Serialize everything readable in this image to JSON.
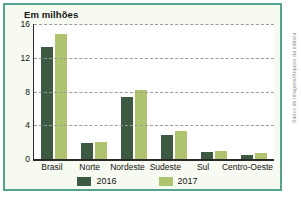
{
  "chart_data": {
    "type": "bar",
    "title": "Em milhões",
    "categories": [
      "Brasil",
      "Norte",
      "Nordeste",
      "Sudeste",
      "Sul",
      "Centro-Oeste"
    ],
    "series": [
      {
        "name": "2016",
        "color": "#3c5a41",
        "values": [
          13.3,
          1.9,
          7.4,
          2.9,
          0.8,
          0.5
        ]
      },
      {
        "name": "2017",
        "color": "#aec46f",
        "values": [
          14.8,
          2.0,
          8.2,
          3.3,
          1.0,
          0.7
        ]
      }
    ],
    "ylabel": "Em milhões",
    "xlabel": "",
    "ylim": [
      0,
      16
    ],
    "yticks": [
      0,
      4,
      8,
      12,
      16
    ],
    "grid": "horizontal-dashed",
    "legend_position": "bottom"
  },
  "credit": "Banco de imagens/Arquivo da editora",
  "colors": {
    "panel_border": "#55a28d",
    "panel_background": "#f7faf1",
    "plot_background": "#ffffff",
    "gridline": "#9b9b9b",
    "axis": "#2a2a2a",
    "text": "#141414",
    "credit_text": "#8f8f8f",
    "series_2016": "#3c5a41",
    "series_2017": "#aec46f"
  }
}
